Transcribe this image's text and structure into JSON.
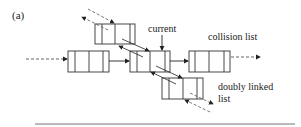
{
  "figure": {
    "panel_label": "(a)",
    "labels": {
      "current": "current",
      "collision_list": "collision list",
      "doubly_linked_line1": "doubly linked",
      "doubly_linked_line2": "list"
    },
    "colors": {
      "stroke": "#333333",
      "dashed": "#555555",
      "rule": "#777777"
    },
    "nodes": [
      {
        "id": "top",
        "x": 95,
        "y": 24,
        "w": 40,
        "h": 20
      },
      {
        "id": "left",
        "x": 68,
        "y": 51,
        "w": 41,
        "h": 21
      },
      {
        "id": "current",
        "x": 130,
        "y": 51,
        "w": 40,
        "h": 21
      },
      {
        "id": "collision",
        "x": 189,
        "y": 51,
        "w": 41,
        "h": 21
      },
      {
        "id": "bottom",
        "x": 162,
        "y": 78,
        "w": 41,
        "h": 21
      }
    ]
  }
}
